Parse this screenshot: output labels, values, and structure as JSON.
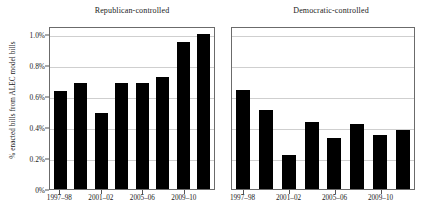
{
  "chart_data": {
    "type": "bar",
    "title": "",
    "xlabel": "",
    "ylabel": "% enacted bills from ALEC model bills",
    "ylim": [
      0,
      1.05
    ],
    "grid": true,
    "legend": "none",
    "orientation": "vertical",
    "bar_color": "#000000",
    "ytick_labels": [
      "0%",
      "0.2%",
      "0.4%",
      "0.6%",
      "0.8%",
      "1.0%"
    ],
    "ytick_values": [
      0,
      0.2,
      0.4,
      0.6,
      0.8,
      1.0
    ],
    "categories": [
      "1997–98",
      "1999–2000",
      "2001–02",
      "2003–04",
      "2005–06",
      "2007–08",
      "2009–10",
      "2011–12"
    ],
    "xtick_labels": [
      "1997–98",
      "2001–02",
      "2005–06",
      "2009–10"
    ],
    "xtick_category_indices": [
      0,
      2,
      4,
      6
    ],
    "panels": [
      {
        "title": "Republican-controlled",
        "values": [
          0.63,
          0.68,
          0.49,
          0.68,
          0.68,
          0.72,
          0.95,
          1.0
        ]
      },
      {
        "title": "Democratic-controlled",
        "values": [
          0.64,
          0.51,
          0.22,
          0.43,
          0.33,
          0.42,
          0.35,
          0.38
        ]
      }
    ]
  }
}
